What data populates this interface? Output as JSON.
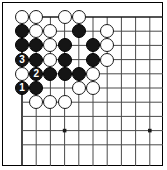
{
  "figure": {
    "kind": "go-board-diagram",
    "width": 167,
    "height": 170,
    "background_color": "#ffffff",
    "border_color": "#000000"
  },
  "board": {
    "grid": {
      "origin_x": 22,
      "origin_y": 17,
      "spacing": 14.2,
      "cols": 10,
      "rows": 10,
      "line_color": "#4a4a4a",
      "edge_line_color": "#1a1a1a",
      "edge_top_row": 1,
      "edge_left_col": 1,
      "show_grid": true
    },
    "star_points": [
      {
        "col": 7,
        "row": 4
      },
      {
        "col": 4,
        "row": 9
      },
      {
        "col": 10,
        "row": 9
      }
    ],
    "star_point_color": "#1a1a1a",
    "stone_radius": 7.1,
    "colors": {
      "black": "#151515",
      "white": "#ffffff",
      "black_label": "#ffffff",
      "white_label": "#000000"
    }
  },
  "stones": [
    {
      "col": 1,
      "row": 1,
      "color": "white",
      "label": ""
    },
    {
      "col": 2,
      "row": 1,
      "color": "white",
      "label": ""
    },
    {
      "col": 4,
      "row": 1,
      "color": "white",
      "label": ""
    },
    {
      "col": 5,
      "row": 1,
      "color": "white",
      "label": ""
    },
    {
      "col": 1,
      "row": 2,
      "color": "black",
      "label": ""
    },
    {
      "col": 2,
      "row": 2,
      "color": "white",
      "label": ""
    },
    {
      "col": 3,
      "row": 2,
      "color": "white",
      "label": ""
    },
    {
      "col": 5,
      "row": 2,
      "color": "black",
      "label": ""
    },
    {
      "col": 7,
      "row": 2,
      "color": "white",
      "label": ""
    },
    {
      "col": 1,
      "row": 3,
      "color": "black",
      "label": ""
    },
    {
      "col": 2,
      "row": 3,
      "color": "black",
      "label": ""
    },
    {
      "col": 3,
      "row": 3,
      "color": "white",
      "label": ""
    },
    {
      "col": 4,
      "row": 3,
      "color": "black",
      "label": ""
    },
    {
      "col": 6,
      "row": 3,
      "color": "black",
      "label": ""
    },
    {
      "col": 7,
      "row": 3,
      "color": "white",
      "label": ""
    },
    {
      "col": 1,
      "row": 4,
      "color": "black",
      "label": "3"
    },
    {
      "col": 2,
      "row": 4,
      "color": "black",
      "label": ""
    },
    {
      "col": 3,
      "row": 4,
      "color": "white",
      "label": ""
    },
    {
      "col": 4,
      "row": 4,
      "color": "black",
      "label": ""
    },
    {
      "col": 6,
      "row": 4,
      "color": "black",
      "label": ""
    },
    {
      "col": 7,
      "row": 4,
      "color": "white",
      "label": ""
    },
    {
      "col": 1,
      "row": 5,
      "color": "white",
      "label": ""
    },
    {
      "col": 2,
      "row": 5,
      "color": "black",
      "label": "2"
    },
    {
      "col": 3,
      "row": 5,
      "color": "black",
      "label": ""
    },
    {
      "col": 4,
      "row": 5,
      "color": "black",
      "label": ""
    },
    {
      "col": 5,
      "row": 5,
      "color": "black",
      "label": ""
    },
    {
      "col": 6,
      "row": 5,
      "color": "white",
      "label": ""
    },
    {
      "col": 1,
      "row": 6,
      "color": "black",
      "label": "1"
    },
    {
      "col": 2,
      "row": 6,
      "color": "black",
      "label": ""
    },
    {
      "col": 5,
      "row": 6,
      "color": "white",
      "label": ""
    },
    {
      "col": 6,
      "row": 6,
      "color": "white",
      "label": ""
    },
    {
      "col": 2,
      "row": 7,
      "color": "white",
      "label": ""
    },
    {
      "col": 3,
      "row": 7,
      "color": "white",
      "label": ""
    },
    {
      "col": 4,
      "row": 7,
      "color": "white",
      "label": ""
    }
  ],
  "move_markers": [
    {
      "number": "1",
      "col": 1,
      "row": 6,
      "color": "black"
    },
    {
      "number": "2",
      "col": 2,
      "row": 5,
      "color": "black"
    },
    {
      "number": "3",
      "col": 1,
      "row": 4,
      "color": "black"
    }
  ]
}
